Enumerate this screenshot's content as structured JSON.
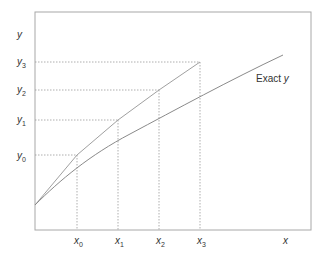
{
  "diagram": {
    "type": "euler-method-illustration",
    "axis_labels": {
      "x": "x",
      "y": "y"
    },
    "x_ticks": [
      {
        "base": "x",
        "sub": "0"
      },
      {
        "base": "x",
        "sub": "1"
      },
      {
        "base": "x",
        "sub": "2"
      },
      {
        "base": "x",
        "sub": "3"
      }
    ],
    "y_ticks": [
      {
        "base": "y",
        "sub": "0"
      },
      {
        "base": "y",
        "sub": "1"
      },
      {
        "base": "y",
        "sub": "2"
      },
      {
        "base": "y",
        "sub": "3"
      }
    ],
    "curve_label": {
      "text": "Exact ",
      "var": "y"
    },
    "colors": {
      "frame": "#9a9a9a",
      "curve": "#8a8a8a",
      "euler": "#a0a0a0",
      "guide": "#9a9a9a",
      "text": "#333333"
    }
  }
}
